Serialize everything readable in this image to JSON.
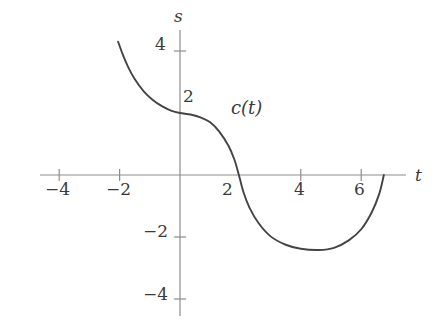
{
  "figure": {
    "kind": "cartesian-plot",
    "width": 437,
    "height": 332,
    "background": "#ffffff",
    "axis_color": "#8d8d8d",
    "curve_color": "#444444",
    "text_color": "#3b3b3b"
  },
  "axes": {
    "x": {
      "name": "t",
      "label_x": 415,
      "label_y": 167
    },
    "y": {
      "name": "s",
      "label_x": 174,
      "label_y": 8
    }
  },
  "curve_label": {
    "text": "c(t)",
    "x": 231,
    "y": 99
  },
  "x_ticks": [
    {
      "value": -4,
      "label": "−4",
      "px": 57,
      "label_x": 45,
      "label_y": 181
    },
    {
      "value": -2,
      "label": "−2",
      "px": 118,
      "label_x": 106,
      "label_y": 181
    },
    {
      "value": 2,
      "label": "2",
      "px": 240,
      "label_x": 222,
      "label_y": 181,
      "tick_hidden": true
    },
    {
      "value": 4,
      "label": "4",
      "px": 300,
      "label_x": 294,
      "label_y": 181
    },
    {
      "value": 6,
      "label": "6",
      "px": 360,
      "label_x": 354,
      "label_y": 181
    }
  ],
  "y_ticks": [
    {
      "value": 4,
      "label": "4",
      "px": 45,
      "label_x": 155,
      "label_y": 36
    },
    {
      "value": 2,
      "label": "2",
      "px": 113,
      "label_x": 183,
      "label_y": 88,
      "tick_hidden": true
    },
    {
      "value": -2,
      "label": "−2",
      "px": 232,
      "label_x": 143,
      "label_y": 223
    },
    {
      "value": -4,
      "label": "−4",
      "px": 295,
      "label_x": 143,
      "label_y": 286
    }
  ],
  "chart_data": {
    "type": "line",
    "title": "",
    "xlabel": "t",
    "ylabel": "s",
    "series_name": "c(t)",
    "xlim": [
      -4.7,
      7.5
    ],
    "ylim": [
      -4.8,
      4.9
    ],
    "grid": false,
    "legend": "none",
    "x_tick_values": [
      -4,
      -2,
      2,
      4,
      6
    ],
    "y_tick_values": [
      4,
      2,
      -2,
      -4
    ],
    "domain": [
      -2.05,
      6.75
    ],
    "notes": [
      "Curve enters at upper left near t = -2.05, s = 4.3 and falls steeply.",
      "It flattens into a plateau and crosses the s-axis at s = 2.",
      "A second steep drop crosses the t-axis near t = 1.95.",
      "The curve bottoms out in a broad U with minimum near t = 4.6, s = -2.4.",
      "It rises back and terminates on the t-axis near t = 6.75."
    ],
    "points": [
      {
        "t": -2.05,
        "s": 4.3
      },
      {
        "t": -1.9,
        "s": 3.9
      },
      {
        "t": -1.7,
        "s": 3.45
      },
      {
        "t": -1.5,
        "s": 3.1
      },
      {
        "t": -1.2,
        "s": 2.7
      },
      {
        "t": -0.9,
        "s": 2.42
      },
      {
        "t": -0.6,
        "s": 2.22
      },
      {
        "t": -0.3,
        "s": 2.08
      },
      {
        "t": 0.0,
        "s": 2.0
      },
      {
        "t": 0.35,
        "s": 1.95
      },
      {
        "t": 0.7,
        "s": 1.85
      },
      {
        "t": 1.0,
        "s": 1.7
      },
      {
        "t": 1.3,
        "s": 1.4
      },
      {
        "t": 1.6,
        "s": 0.95
      },
      {
        "t": 1.8,
        "s": 0.5
      },
      {
        "t": 1.95,
        "s": 0.0
      },
      {
        "t": 2.1,
        "s": -0.55
      },
      {
        "t": 2.3,
        "s": -1.05
      },
      {
        "t": 2.6,
        "s": -1.55
      },
      {
        "t": 3.0,
        "s": -1.98
      },
      {
        "t": 3.5,
        "s": -2.25
      },
      {
        "t": 4.0,
        "s": -2.38
      },
      {
        "t": 4.6,
        "s": -2.42
      },
      {
        "t": 5.1,
        "s": -2.35
      },
      {
        "t": 5.6,
        "s": -2.1
      },
      {
        "t": 6.0,
        "s": -1.75
      },
      {
        "t": 6.35,
        "s": -1.2
      },
      {
        "t": 6.6,
        "s": -0.6
      },
      {
        "t": 6.75,
        "s": 0.0
      }
    ]
  }
}
